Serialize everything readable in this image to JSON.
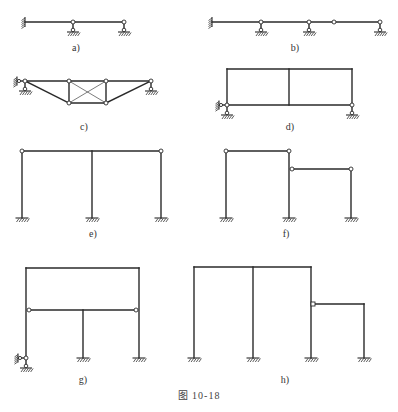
{
  "figure": {
    "caption": "图   10-18",
    "colors": {
      "line": "#2a2a2a",
      "background": "#ffffff",
      "hinge_fill": "#ffffff"
    }
  },
  "panels": [
    {
      "id": "a",
      "label": "a)",
      "label_pos": [
        76,
        51
      ],
      "members": [
        [
          25,
          22,
          124,
          22
        ]
      ],
      "braces": [],
      "hinges": [
        [
          73,
          22
        ],
        [
          124,
          22
        ]
      ],
      "fixed_walls": [
        {
          "x": 25,
          "y": 22,
          "side": "left",
          "len": 10
        }
      ],
      "fixed_grounds": [],
      "pin_supports": [
        [
          73,
          22
        ],
        [
          124,
          22
        ]
      ]
    },
    {
      "id": "b",
      "label": "b)",
      "label_pos": [
        295,
        51
      ],
      "members": [
        [
          212,
          22
        ],
        [
          380,
          22
        ]
      ],
      "members_full": [
        [
          212,
          22,
          380,
          22
        ]
      ],
      "hinges": [
        [
          261,
          22
        ],
        [
          309,
          22
        ],
        [
          334,
          22
        ],
        [
          380,
          22
        ]
      ],
      "fixed_walls": [
        {
          "x": 212,
          "y": 22,
          "side": "left",
          "len": 10
        }
      ],
      "pin_supports": [
        [
          261,
          22
        ],
        [
          309,
          22
        ],
        [
          380,
          22
        ]
      ]
    },
    {
      "id": "c",
      "label": "c)",
      "label_pos": [
        84,
        130
      ],
      "members": [
        [
          25,
          81,
          151,
          81
        ],
        [
          25,
          81,
          69,
          103
        ],
        [
          69,
          103,
          106,
          103
        ],
        [
          106,
          103,
          151,
          81
        ],
        [
          69,
          81,
          69,
          103
        ],
        [
          106,
          81,
          106,
          103
        ]
      ],
      "braces": [
        [
          69,
          81,
          106,
          103
        ],
        [
          106,
          81,
          69,
          103
        ]
      ],
      "hinges": [
        [
          25,
          81
        ],
        [
          69,
          81
        ],
        [
          106,
          81
        ],
        [
          151,
          81
        ],
        [
          69,
          103
        ],
        [
          106,
          103
        ]
      ],
      "pin_supports": [
        [
          25,
          81
        ],
        [
          151,
          81
        ]
      ],
      "side_links": [
        {
          "x": 25,
          "y": 81
        }
      ]
    },
    {
      "id": "d",
      "label": "d)",
      "label_pos": [
        290,
        130
      ],
      "members": [
        [
          227,
          69,
          352,
          69
        ],
        [
          227,
          69,
          227,
          105
        ],
        [
          352,
          69,
          352,
          105
        ],
        [
          227,
          105,
          352,
          105
        ],
        [
          289,
          69,
          289,
          105
        ]
      ],
      "braces": [],
      "hinges": [
        [
          227,
          105
        ],
        [
          352,
          105
        ]
      ],
      "pin_supports": [
        [
          227,
          105
        ],
        [
          352,
          105
        ]
      ],
      "side_links": [
        {
          "x": 227,
          "y": 105
        }
      ]
    },
    {
      "id": "e",
      "label": "e)",
      "label_pos": [
        93,
        237
      ],
      "members": [
        [
          22,
          151,
          161,
          151
        ],
        [
          22,
          151,
          22,
          218
        ],
        [
          92,
          151,
          92,
          218
        ],
        [
          161,
          151,
          161,
          218
        ]
      ],
      "hinges": [
        [
          22,
          151
        ],
        [
          161,
          151
        ]
      ],
      "fixed_grounds": [
        [
          22,
          218
        ],
        [
          92,
          218
        ],
        [
          161,
          218
        ]
      ]
    },
    {
      "id": "f",
      "label": "f)",
      "label_pos": [
        286,
        237
      ],
      "members": [
        [
          226,
          151,
          289,
          151
        ],
        [
          226,
          151,
          226,
          218
        ],
        [
          289,
          151,
          289,
          218
        ],
        [
          292,
          169,
          351,
          169
        ],
        [
          351,
          169,
          351,
          218
        ]
      ],
      "hinges": [
        [
          226,
          151
        ],
        [
          289,
          151
        ],
        [
          292,
          169
        ],
        [
          351,
          169
        ]
      ],
      "fixed_grounds": [
        [
          226,
          218
        ],
        [
          289,
          218
        ],
        [
          351,
          218
        ]
      ]
    },
    {
      "id": "g",
      "label": "g)",
      "label_pos": [
        83,
        383
      ],
      "members": [
        [
          26,
          268,
          139,
          268
        ],
        [
          26,
          268,
          26,
          358
        ],
        [
          139,
          268,
          139,
          358
        ],
        [
          29,
          310,
          136,
          310
        ],
        [
          83,
          310,
          83,
          358
        ]
      ],
      "hinges": [
        [
          29,
          310
        ],
        [
          136,
          310
        ],
        [
          26,
          358
        ]
      ],
      "pin_supports": [
        [
          26,
          358
        ]
      ],
      "side_links": [
        {
          "x": 26,
          "y": 358
        }
      ],
      "fixed_grounds": [
        [
          83,
          358
        ],
        [
          139,
          358
        ]
      ]
    },
    {
      "id": "h",
      "label": "h)",
      "label_pos": [
        285,
        383
      ],
      "members": [
        [
          194,
          267,
          311,
          267
        ],
        [
          194,
          267,
          194,
          358
        ],
        [
          253,
          267,
          253,
          358
        ],
        [
          311,
          267,
          311,
          358
        ],
        [
          314,
          304,
          364,
          304
        ],
        [
          364,
          304,
          364,
          358
        ]
      ],
      "hinges": [
        [
          313,
          304
        ]
      ],
      "hinge_square": true,
      "fixed_grounds": [
        [
          194,
          358
        ],
        [
          253,
          358
        ],
        [
          311,
          358
        ],
        [
          364,
          358
        ]
      ]
    }
  ]
}
